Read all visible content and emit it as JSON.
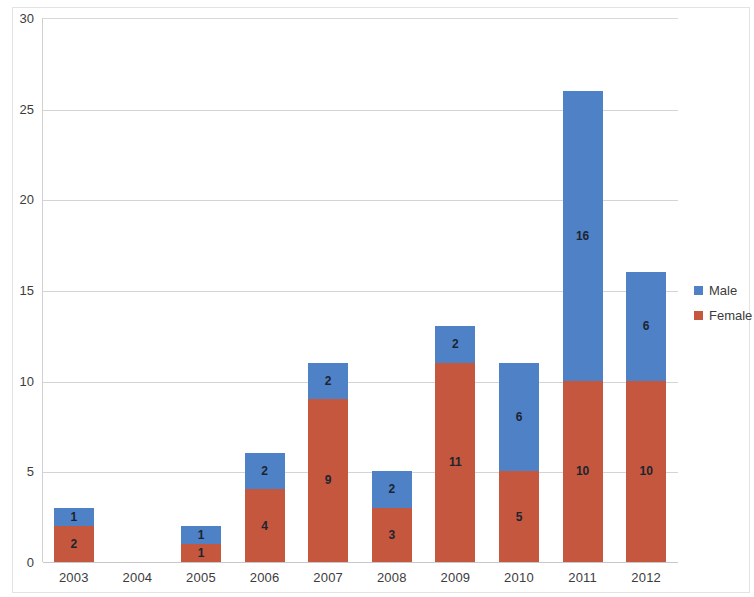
{
  "chart_data": {
    "type": "bar",
    "subtype": "stacked-bar",
    "title": "",
    "xlabel": "",
    "ylabel": "",
    "categories": [
      "2003",
      "2004",
      "2005",
      "2006",
      "2007",
      "2008",
      "2009",
      "2010",
      "2011",
      "2012"
    ],
    "series": [
      {
        "name": "Female",
        "color": "#C5573E",
        "values": [
          2,
          0,
          1,
          4,
          9,
          3,
          11,
          5,
          10,
          10
        ]
      },
      {
        "name": "Male",
        "color": "#4F81C7",
        "values": [
          1,
          0,
          1,
          2,
          2,
          2,
          2,
          6,
          16,
          6
        ]
      }
    ],
    "stack_order": [
      "Female",
      "Male"
    ],
    "totals": [
      3,
      0,
      2,
      6,
      11,
      5,
      13,
      11,
      26,
      16
    ],
    "ylim": [
      0,
      30
    ],
    "y_ticks": [
      0,
      5,
      10,
      15,
      20,
      25,
      30
    ],
    "y_tick_labels": [
      "0",
      "5",
      "10",
      "15",
      "20",
      "25",
      "30"
    ],
    "grid": {
      "horizontal": true,
      "vertical": false
    },
    "data_labels": true,
    "legend": {
      "position": "right",
      "entries": [
        {
          "label": "Male",
          "color": "#4F81C7"
        },
        {
          "label": "Female",
          "color": "#C5573E"
        }
      ]
    }
  },
  "axes": {
    "y_tick_labels": [
      "30",
      "25",
      "20",
      "15",
      "10",
      "5",
      "0"
    ],
    "x_tick_labels": [
      "2003",
      "2004",
      "2005",
      "2006",
      "2007",
      "2008",
      "2009",
      "2010",
      "2011",
      "2012"
    ]
  },
  "legend": {
    "male_label": "Male",
    "female_label": "Female"
  },
  "colors": {
    "male": "#4F81C7",
    "female": "#C5573E",
    "gridline": "#D4D4D4",
    "axis_text": "#3C3C3C",
    "data_label_text": "#1B2430",
    "background": "#FFFFFF"
  }
}
